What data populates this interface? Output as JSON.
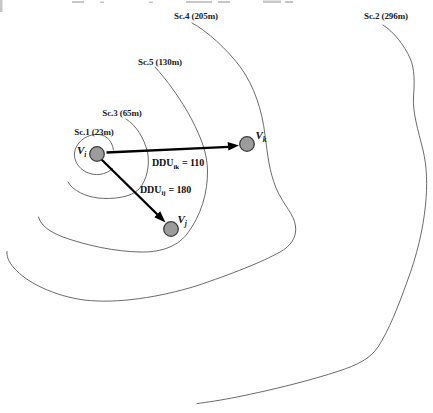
{
  "figure": {
    "type": "contour-scenario-diagram",
    "background": "#ffffff",
    "contour_color": "#5a5a5a",
    "node_fill": "#9c9c9c",
    "node_stroke": "#3d3d3d",
    "arrow_color": "#000000"
  },
  "scenarios": [
    {
      "id": "sc1",
      "name": "Sc.1",
      "distance_m": 23,
      "label": "Sc.1 (23m)"
    },
    {
      "id": "sc3",
      "name": "Sc.3",
      "distance_m": 65,
      "label": "Sc.3 (65m)"
    },
    {
      "id": "sc5",
      "name": "Sc.5",
      "distance_m": 130,
      "label": "Sc.5 (130m)"
    },
    {
      "id": "sc4",
      "name": "Sc.4",
      "distance_m": 205,
      "label": "Sc.4 (205m)"
    },
    {
      "id": "sc2",
      "name": "Sc.2",
      "distance_m": 296,
      "label": "Sc.2 (296m)"
    }
  ],
  "nodes": [
    {
      "id": "vi",
      "label_main": "V",
      "label_sub": "i"
    },
    {
      "id": "vj",
      "label_main": "V",
      "label_sub": "j"
    },
    {
      "id": "vk",
      "label_main": "V",
      "label_sub": "k"
    }
  ],
  "edges": [
    {
      "id": "ik",
      "label_prefix": "DDU",
      "label_sub": "ik",
      "label_suffix": "= 110",
      "value": 110
    },
    {
      "id": "ij",
      "label_prefix": "DDU",
      "label_sub": "ij",
      "label_suffix": "= 180",
      "value": 180
    }
  ]
}
